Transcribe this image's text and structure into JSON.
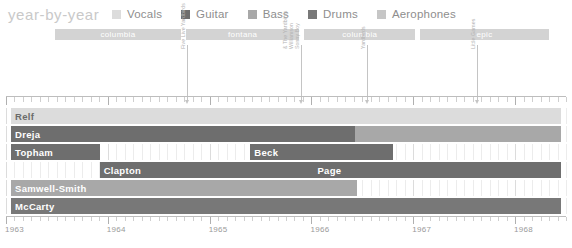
{
  "header": {
    "brand": "year-by-year"
  },
  "legend": {
    "items": [
      {
        "label": "Vocals",
        "color": "#dcdcdc"
      },
      {
        "label": "Guitar",
        "color": "#6e6e6e"
      },
      {
        "label": "Bass",
        "color": "#a8a8a8"
      },
      {
        "label": "Drums",
        "color": "#787878"
      },
      {
        "label": "Aerophones",
        "color": "#c6c6c6"
      }
    ]
  },
  "record_labels": [
    {
      "name": "columbia",
      "start": 1963.48,
      "end": 1964.72
    },
    {
      "name": "fontana",
      "start": 1964.77,
      "end": 1965.88
    },
    {
      "name": "columbia",
      "start": 1965.93,
      "end": 1967.02
    },
    {
      "name": "epic",
      "start": 1967.07,
      "end": 1968.33
    }
  ],
  "albums": [
    {
      "title": "Five Live Yardbirds",
      "year": 1964.78,
      "lines": [
        "Five Live Yardbirds"
      ]
    },
    {
      "title": "Sonny Boy Williamson & The Yardbirds",
      "year": 1965.9,
      "lines": [
        "Sonny Boy",
        "Williamson",
        "& The Yardbirds"
      ]
    },
    {
      "title": "Yardbirds",
      "year": 1966.55,
      "lines": [
        "Yardbirds"
      ]
    },
    {
      "title": "Little Games",
      "year": 1967.63,
      "lines": [
        "Little Games"
      ]
    }
  ],
  "chart_data": {
    "type": "bar",
    "title": "year-by-year",
    "xlabel": "",
    "ylabel": "",
    "xlim": [
      1963,
      1968.5
    ],
    "grid": true,
    "legend_position": "top",
    "xticks": [
      "1963",
      "1964",
      "1965",
      "1966",
      "1967",
      "1968"
    ],
    "xtick_values": [
      1963,
      1964,
      1965,
      1966,
      1967,
      1968
    ],
    "categories": [
      "Relf",
      "Dreja",
      "Topham",
      "Clapton",
      "Samwell-Smith",
      "Page"
    ],
    "series": [
      {
        "name": "Relf",
        "role": "Vocals",
        "color": "#dcdcdc",
        "label": "Relf",
        "label_color": "#6b6b6b",
        "start": 1963.05,
        "end": 1968.45
      },
      {
        "name": "Dreja-guitar",
        "role": "Guitar",
        "color": "#6e6e6e",
        "label": "Dreja",
        "label_color": "#ffffff",
        "start": 1963.05,
        "end": 1966.43
      },
      {
        "name": "Dreja-bass",
        "role": "Bass",
        "color": "#a8a8a8",
        "label": "",
        "label_color": "#ffffff",
        "start": 1966.43,
        "end": 1968.45
      },
      {
        "name": "Topham",
        "role": "Guitar",
        "color": "#6e6e6e",
        "label": "Topham",
        "label_color": "#ffffff",
        "start": 1963.05,
        "end": 1963.92
      },
      {
        "name": "Beck",
        "role": "Guitar",
        "color": "#6e6e6e",
        "label": "Beck",
        "label_color": "#ffffff",
        "start": 1965.4,
        "end": 1966.8
      },
      {
        "name": "Clapton",
        "role": "Guitar",
        "color": "#6e6e6e",
        "label": "Clapton",
        "label_color": "#ffffff",
        "start": 1963.92,
        "end": 1966.02
      },
      {
        "name": "Page",
        "role": "Guitar",
        "color": "#6e6e6e",
        "label": "Page",
        "label_color": "#ffffff",
        "start": 1966.02,
        "end": 1968.45
      },
      {
        "name": "Samwell-Smith",
        "role": "Bass",
        "color": "#a8a8a8",
        "label": "Samwell-Smith",
        "label_color": "#ffffff",
        "start": 1963.05,
        "end": 1966.45
      },
      {
        "name": "McCarty",
        "role": "Drums",
        "color": "#787878",
        "label": "McCarty",
        "label_color": "#ffffff",
        "start": 1963.05,
        "end": 1968.45
      }
    ],
    "rows": [
      {
        "index": 0,
        "bars": [
          "Relf"
        ]
      },
      {
        "index": 1,
        "bars": [
          "Dreja-guitar",
          "Dreja-bass"
        ]
      },
      {
        "index": 2,
        "bars": [
          "Topham",
          "Beck"
        ]
      },
      {
        "index": 3,
        "bars": [
          "Clapton",
          "Page"
        ]
      },
      {
        "index": 4,
        "bars": [
          "Samwell-Smith"
        ]
      },
      {
        "index": 5,
        "bars": [
          "McCarty"
        ]
      }
    ]
  },
  "colors": {
    "background": "#ffffff",
    "brand": "#c9c9c9",
    "label_bar": "#d3d3d3",
    "grid_minor": "#ececec",
    "grid_major": "#dcdcdc",
    "axis": "#bdbdbd",
    "tick_text": "#9a9a9a",
    "annotation": "#b2b2b2"
  }
}
